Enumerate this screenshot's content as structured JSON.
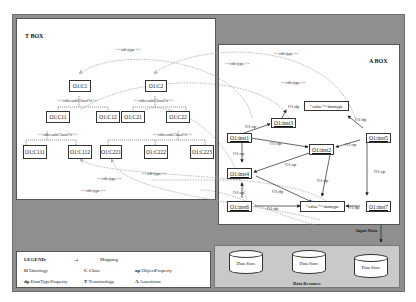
{
  "tbox": {
    "title": "T BOX",
    "classes": {
      "c1": "O1:C1",
      "c2": "O1:C2",
      "c11": "O1:C11",
      "c12": "O1:C12",
      "c21": "O1:C21",
      "c22": "O1:C22",
      "c111": "O1:C111",
      "c112": "O1:C112",
      "c221": "O1:C221",
      "c222": "O1:C222",
      "c223": "O1:C223"
    },
    "subclass_label": "<<rdfs:subClassOf>>",
    "type_label": "<<rdf:type>>"
  },
  "abox": {
    "title": "A BOX",
    "instances": {
      "inst1": "O1:inst1",
      "inst2": "O1:inst2",
      "inst3": "O1:inst3",
      "inst4": "O1:inst4",
      "inst5": "O1:inst5",
      "inst6": "O1:inst6",
      "inst7": "O1:inst7"
    },
    "values": {
      "v1": "\"value\"^^datatype",
      "v2": "\"value\"^^datatype"
    },
    "op_label": "O1:op",
    "dp_label": "O1:dp"
  },
  "legend": {
    "title": "LEGEND:",
    "mapping": "Mapping",
    "items": [
      {
        "key": "O",
        "label": "Ontology"
      },
      {
        "key": "C",
        "label": "Class"
      },
      {
        "key": "op",
        "label": "ObjectProperty"
      },
      {
        "key": "dp",
        "label": "DataTypeProperty"
      },
      {
        "key": "T",
        "label": "Terminology"
      },
      {
        "key": "A",
        "label": "Assertions"
      }
    ]
  },
  "data_resource": {
    "title": "Data Resource",
    "input_label": "Input Data",
    "stores": [
      "Data Store",
      "Data Store",
      "Data Store"
    ]
  }
}
